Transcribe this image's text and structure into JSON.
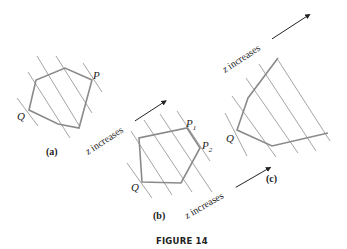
{
  "figure": {
    "caption": "FIGURE 14",
    "panels": [
      {
        "id": "a",
        "label": "(a)",
        "points": [
          "P",
          "Q"
        ]
      },
      {
        "id": "b",
        "label": "(b)",
        "points": [
          "P",
          "P",
          "Q"
        ],
        "subscripts": [
          "1",
          "2"
        ]
      },
      {
        "id": "c",
        "label": "(c)",
        "points": [
          "Q"
        ]
      }
    ],
    "arrows": [
      {
        "text_var": "z",
        "text": " increases"
      },
      {
        "text_var": "z",
        "text": " increases"
      },
      {
        "text_var": "z",
        "text": " increases"
      }
    ]
  },
  "colors": {
    "polygon": "#8a8a8a",
    "level_lines": "#9a9a9a",
    "text": "#222222"
  }
}
